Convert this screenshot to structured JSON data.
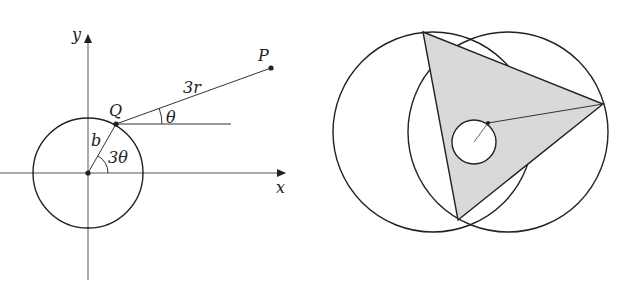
{
  "left_figure": {
    "labels": {
      "y_axis": "y",
      "x_axis": "x",
      "point_p": "P",
      "point_q": "Q",
      "segment_qp": "3r",
      "angle_at_q": "θ",
      "radius": "b",
      "angle_at_origin": "3θ"
    }
  },
  "right_figure": {
    "description": "Two overlapping large circles with a shaded triangle inscribed, containing a small circle with a radius segment"
  },
  "colors": {
    "stroke": "#222222",
    "shade": "#d9d9d9",
    "background": "#ffffff"
  }
}
